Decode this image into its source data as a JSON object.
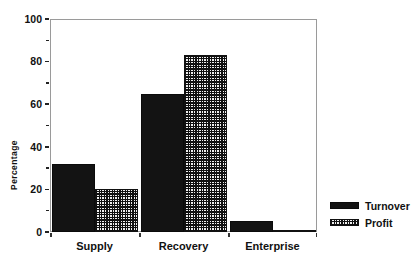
{
  "chart_data": {
    "type": "bar",
    "title": "",
    "subtitle": "",
    "xlabel": "",
    "ylabel": "Percentage",
    "categories": [
      "Supply",
      "Recovery",
      "Enterprise"
    ],
    "series": [
      {
        "name": "Turnover",
        "values": [
          32,
          65,
          5
        ],
        "fill": "solid-black",
        "color": "#131313"
      },
      {
        "name": "Profit",
        "values": [
          20,
          83,
          1
        ],
        "fill": "checkered-hatch",
        "color": "#101010"
      }
    ],
    "ylim": [
      0,
      100
    ],
    "ytick_labels": [
      "0",
      "20",
      "40",
      "60",
      "80",
      "100"
    ],
    "ytick_values": [
      0,
      20,
      40,
      60,
      80,
      100
    ],
    "yminor_tick_values": [
      10,
      30,
      50,
      70,
      90
    ],
    "grid": false,
    "legend_position": "right",
    "legend_entries": [
      "Turnover",
      "Profit"
    ]
  },
  "axis": {
    "y_title": "Percentage"
  },
  "legend": {
    "items": [
      {
        "label": "Turnover"
      },
      {
        "label": "Profit"
      }
    ]
  }
}
